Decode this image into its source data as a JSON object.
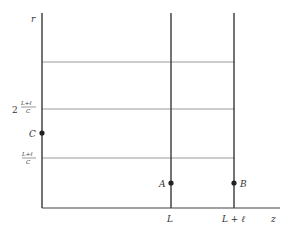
{
  "diagram": {
    "axes": {
      "vertical_label": "r",
      "horizontal_label": "z"
    },
    "y_ticks": [
      {
        "label_prefix": "2",
        "num": "L+ℓ",
        "den": "C"
      },
      {
        "label_prefix": "",
        "num": "L+ℓ",
        "den": "C"
      }
    ],
    "x_ticks": [
      {
        "label": "L"
      },
      {
        "label": "L + ℓ"
      }
    ],
    "points": [
      {
        "name": "C",
        "label": "C"
      },
      {
        "name": "A",
        "label": "A"
      },
      {
        "name": "B",
        "label": "B"
      }
    ],
    "colors": {
      "line": "#444444",
      "thin_line": "#888888",
      "text": "#333333"
    }
  }
}
